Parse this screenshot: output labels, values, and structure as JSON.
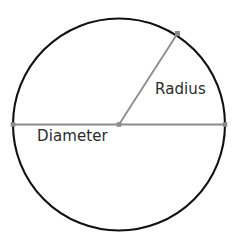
{
  "diagram": {
    "name": "circle-radius-diameter-diagram",
    "background_color": "#ffffff",
    "canvas": {
      "width": 239,
      "height": 249
    },
    "circle": {
      "name": "circle-outline",
      "center_x": 119,
      "center_y": 124.5,
      "radius": 106,
      "stroke_color": "#111111",
      "stroke_width": 2.1,
      "fill": "none"
    },
    "diameter_line": {
      "name": "diameter-line",
      "x1": 13,
      "y1": 124.5,
      "x2": 225,
      "y2": 124.5,
      "stroke_color": "#8a8a8a",
      "stroke_width": 1.8
    },
    "radius_line": {
      "name": "radius-line",
      "x1": 119,
      "y1": 124.5,
      "x2": 177.5,
      "y2": 33.5,
      "stroke_color": "#8a8a8a",
      "stroke_width": 1.8
    },
    "points": [
      {
        "name": "diameter-left-endpoint-dot",
        "x": 13,
        "y": 124.5,
        "size": 4.6,
        "color": "#8a8a8a"
      },
      {
        "name": "diameter-right-endpoint-dot",
        "x": 225,
        "y": 124.5,
        "size": 4.6,
        "color": "#8a8a8a"
      },
      {
        "name": "circle-center-dot",
        "x": 119,
        "y": 124.5,
        "size": 4.6,
        "color": "#8a8a8a"
      },
      {
        "name": "radius-endpoint-dot",
        "x": 177.5,
        "y": 33.5,
        "size": 5.0,
        "color": "#8a8a8a"
      }
    ],
    "labels": {
      "radius": {
        "text": "Radius",
        "x": 155,
        "y": 94,
        "color": "#2b2b2b",
        "font_size": 15
      },
      "diameter": {
        "text": "Diameter",
        "x": 37,
        "y": 141,
        "color": "#2b2b2b",
        "font_size": 15
      }
    }
  }
}
